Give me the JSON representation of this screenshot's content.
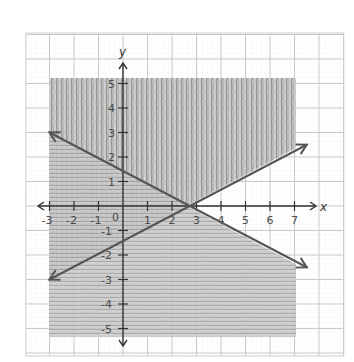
{
  "chart_data": {
    "type": "line",
    "title": "",
    "xlabel": "x",
    "ylabel": "y",
    "xlim": [
      -3,
      7
    ],
    "ylim": [
      -5,
      5
    ],
    "grid": true,
    "x_ticks": [
      -3,
      -2,
      -1,
      0,
      1,
      2,
      3,
      4,
      5,
      6,
      7
    ],
    "y_ticks": [
      -5,
      -4,
      -3,
      -2,
      -1,
      1,
      2,
      3,
      4,
      5
    ],
    "x_tick_labels": [
      "-3",
      "-2",
      "-1",
      "0",
      "1",
      "2",
      "3",
      "4",
      "5",
      "6",
      "7"
    ],
    "y_tick_labels": [
      "-5",
      "-4",
      "-3",
      "-2",
      "-1",
      "1",
      "2",
      "3",
      "4",
      "5"
    ],
    "series": [
      {
        "name": "decreasing boundary line",
        "x": [
          -3,
          7.5
        ],
        "y": [
          3,
          -2.5
        ],
        "slope": -0.52,
        "y_intercept": 1.3,
        "arrows": "both"
      },
      {
        "name": "increasing boundary line",
        "x": [
          -3,
          7.5
        ],
        "y": [
          -3,
          2.5
        ],
        "slope": 0.52,
        "y_intercept": -1.3,
        "arrows": "both"
      }
    ],
    "shaded_regions": [
      {
        "name": "above increasing line",
        "style": "vertical strokes",
        "x_range": [
          -3,
          7
        ],
        "y_top": 5
      },
      {
        "name": "below decreasing line",
        "style": "horizontal strokes",
        "x_range": [
          -3,
          7
        ],
        "y_bottom": -5
      }
    ],
    "intersection": {
      "x": 2.5,
      "y": 0
    }
  },
  "axes": {
    "x_label": "x",
    "y_label": "y",
    "origin_label": "0"
  },
  "colors": {
    "grid_major": "#c8c8c8",
    "grid_minor": "#e6e6e6",
    "axis": "#333333",
    "line": "#5a5a5a",
    "shade": "#9a9a9a"
  }
}
